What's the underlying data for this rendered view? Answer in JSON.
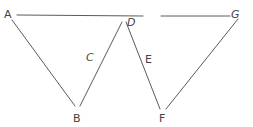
{
  "diagram": {
    "type": "geometry-line-figure",
    "colors": {
      "line": "#5a5a5a",
      "label": "#444444",
      "background": "#ffffff"
    },
    "points": {
      "A": {
        "label": "A",
        "x": 9,
        "y": 13
      },
      "B": {
        "label": "B",
        "x": 77,
        "y": 119
      },
      "C": {
        "label": "C",
        "x": 90,
        "y": 58
      },
      "D": {
        "label": "D",
        "x": 131,
        "y": 23
      },
      "E": {
        "label": "E",
        "x": 147,
        "y": 59
      },
      "F": {
        "label": "F",
        "x": 162,
        "y": 119
      },
      "G": {
        "label": "G",
        "x": 236,
        "y": 15
      }
    },
    "segments": [
      {
        "id": "A-D-top",
        "from": "A",
        "to": "D",
        "x1": 17,
        "y1": 15,
        "x2": 143,
        "y2": 16
      },
      {
        "id": "top-to-G",
        "from": "D",
        "to": "G",
        "x1": 161,
        "y1": 16,
        "x2": 230,
        "y2": 16
      },
      {
        "id": "A-B",
        "from": "A",
        "to": "B",
        "x1": 12,
        "y1": 20,
        "x2": 75,
        "y2": 106
      },
      {
        "id": "B-D",
        "from": "B",
        "to": "D",
        "via": "C",
        "x1": 80,
        "y1": 106,
        "x2": 122,
        "y2": 22
      },
      {
        "id": "D-F",
        "from": "D",
        "to": "F",
        "via": "E",
        "x1": 126,
        "y1": 22,
        "x2": 160,
        "y2": 109
      },
      {
        "id": "F-G",
        "from": "F",
        "to": "G",
        "x1": 166,
        "y1": 109,
        "x2": 238,
        "y2": 19
      }
    ]
  }
}
